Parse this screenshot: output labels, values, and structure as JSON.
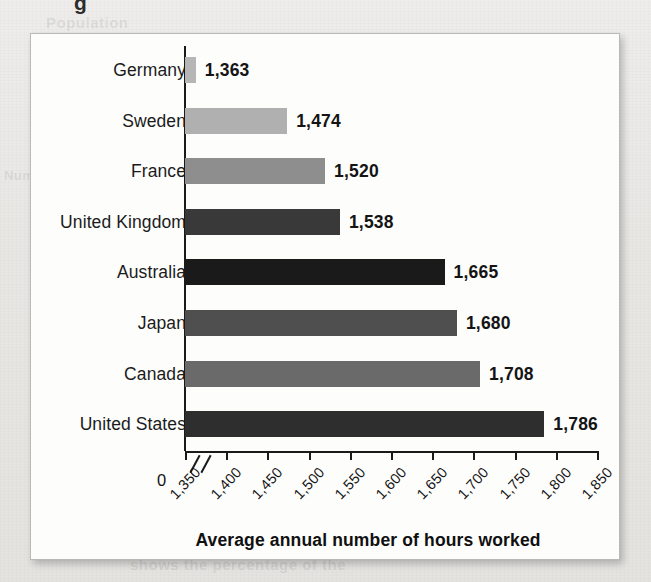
{
  "page": {
    "background_color": "#e9e9e7",
    "panel_color": "#fdfdfc",
    "ghost_text_top": "Population",
    "ghost_text_left": "Number of",
    "ghost_text_bottom": "shows the percentage of the",
    "ghost_descender": "g"
  },
  "chart_data": {
    "type": "bar",
    "orientation": "horizontal",
    "title": "",
    "xlabel": "Average annual number of hours worked",
    "ylabel": "",
    "categories": [
      "Germany",
      "Sweden",
      "France",
      "United Kingdom",
      "Australia",
      "Japan",
      "Canada",
      "United States"
    ],
    "values": [
      1363,
      1474,
      1520,
      1538,
      1665,
      1680,
      1708,
      1786
    ],
    "value_labels": [
      "1,363",
      "1,474",
      "1,520",
      "1,538",
      "1,665",
      "1,680",
      "1,708",
      "1,786"
    ],
    "bar_colors": [
      "#b6b6b6",
      "#b0b0b0",
      "#8e8e8e",
      "#393939",
      "#1a1a1a",
      "#4f4f4f",
      "#6a6a6a",
      "#2e2e2e"
    ],
    "xlim": [
      1350,
      1850
    ],
    "xticks": [
      1350,
      1400,
      1450,
      1500,
      1550,
      1600,
      1650,
      1700,
      1750,
      1800,
      1850
    ],
    "xtick_labels": [
      "1,350",
      "1,400",
      "1,450",
      "1,500",
      "1,550",
      "1,600",
      "1,650",
      "1,700",
      "1,750",
      "1,800",
      "1,850"
    ],
    "origin_label": "0",
    "axis_break": true,
    "grid": false,
    "legend": null
  }
}
